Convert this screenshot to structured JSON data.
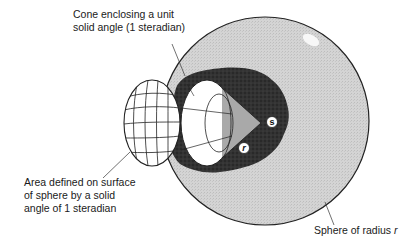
{
  "diagram": {
    "title": "Solid angle of 1 steradian",
    "labels": {
      "cone": {
        "lines": [
          "Cone enclosing a unit",
          "solid angle (1 steradian)"
        ]
      },
      "area": {
        "lines": [
          "Area defined on surface",
          "of sphere by a solid",
          "angle of 1 steradian"
        ]
      },
      "sphere": {
        "text": "Sphere of radius ",
        "variable": "r"
      }
    },
    "markers": {
      "center": "s",
      "radius": "r"
    },
    "colors": {
      "sphere_fill": "#d6d6d6",
      "sphere_outline": "#222222",
      "cavity_fill": "#2e2e2e",
      "cone_fill": "#a8a8a8",
      "cap_fill": "#ffffff",
      "highlight": "#f6f6f6",
      "text": "#1a1a1a"
    }
  }
}
